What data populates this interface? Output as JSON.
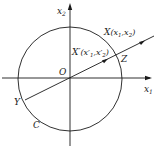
{
  "diagram": {
    "axes": {
      "x_label": "x",
      "x_sub": "1",
      "y_label": "x",
      "y_sub": "2"
    },
    "origin_label": "O",
    "circle_label": "C",
    "points": {
      "X": {
        "name": "X",
        "coords_open": "(x",
        "s1": "1",
        "comma": ",x",
        "s2": "2",
        "close": ")"
      },
      "Xp": {
        "name": "X′",
        "coords_open": "(x′",
        "s1": "1",
        "comma": ",x′",
        "s2": "2",
        "close": ")"
      },
      "Z": {
        "name": "Z"
      },
      "Y": {
        "name": "Y"
      }
    },
    "colors": {
      "stroke": "#1a1a1a",
      "background": "#ffffff"
    }
  }
}
